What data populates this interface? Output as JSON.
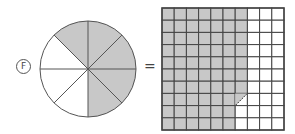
{
  "problem_label": "F",
  "equals_sign": "=",
  "colors": {
    "shade": "#c8c8c8",
    "line": "#555555",
    "grid_line": "#444444"
  },
  "circle": {
    "total_slices": 8,
    "shaded_slices": 5
  },
  "grid": {
    "rows": 10,
    "cols": 10,
    "shaded_full_cols_rows_1_7": 7,
    "shaded_full_cols_rows_8_10": 6,
    "partial_cell": {
      "row": 8,
      "col": 7,
      "type": "diagonal-half"
    }
  }
}
